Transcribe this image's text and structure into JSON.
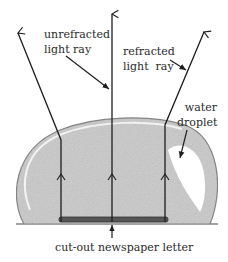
{
  "diagram": {
    "labels": {
      "unrefracted_line1": "unrefracted",
      "unrefracted_line2": "light ray",
      "refracted_line1": "refracted",
      "refracted_line2": "light  ray",
      "water_line1": "water",
      "water_line2": "droplet",
      "letter": "cut-out newspaper letter"
    },
    "colors": {
      "ink": "#1e1e1e",
      "droplet_fill": "#cfcfcf",
      "droplet_edge": "#8a8a8a",
      "letter": "#555555",
      "highlight": "#ffffff"
    }
  }
}
